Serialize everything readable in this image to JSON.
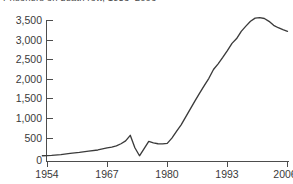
{
  "chart_data": {
    "type": "line",
    "title": "Prisoners on death row, 1953–2006",
    "xlabel": "",
    "ylabel": "",
    "xlim": [
      1953,
      2006
    ],
    "ylim": [
      0,
      3750
    ],
    "grid": false,
    "legend": null,
    "xticks": [
      "1954",
      "1967",
      "1980",
      "1993",
      "2006"
    ],
    "xtick_values": [
      1954,
      1967,
      1980,
      1993,
      2006
    ],
    "yticks": [
      "0",
      "500",
      "1,000",
      "1,500",
      "2,000",
      "2,500",
      "3,000",
      "3,500"
    ],
    "ytick_values": [
      0,
      500,
      1000,
      1500,
      2000,
      2500,
      3000,
      3500
    ],
    "series": [
      {
        "name": "Prisoners on death row",
        "color": "#3b3b3b",
        "x": [
          1953,
          1955,
          1957,
          1959,
          1961,
          1963,
          1965,
          1967,
          1968,
          1969,
          1970,
          1971,
          1972,
          1973,
          1974,
          1975,
          1976,
          1977,
          1978,
          1979,
          1980,
          1981,
          1982,
          1983,
          1984,
          1985,
          1986,
          1987,
          1988,
          1989,
          1990,
          1991,
          1992,
          1993,
          1994,
          1995,
          1996,
          1997,
          1998,
          1999,
          2000,
          2001,
          2002,
          2003,
          2004,
          2005,
          2006
        ],
        "values": [
          130,
          140,
          160,
          190,
          215,
          245,
          275,
          325,
          345,
          375,
          430,
          500,
          640,
          330,
          130,
          310,
          490,
          450,
          430,
          425,
          440,
          570,
          740,
          900,
          1100,
          1300,
          1500,
          1690,
          1880,
          2060,
          2280,
          2420,
          2580,
          2750,
          2930,
          3050,
          3230,
          3360,
          3480,
          3560,
          3570,
          3550,
          3480,
          3380,
          3320,
          3270,
          3230
        ]
      }
    ],
    "annotations": [
      {
        "text": "1972 Furman v. Georgia drop",
        "visible": false
      }
    ]
  },
  "watermarks": {
    "plot": "",
    "footer": ""
  }
}
